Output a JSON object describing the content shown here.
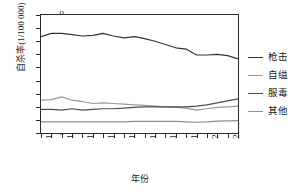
{
  "chart_data": {
    "type": "line",
    "title": "",
    "xlabel": "年份",
    "ylabel": "自杀率(1/100 000)",
    "xlim": [
      1985,
      2004
    ],
    "ylim": [
      0,
      9
    ],
    "yticks": [
      0,
      1,
      2,
      3,
      4,
      5,
      6,
      7,
      8,
      9
    ],
    "xticks": [
      1985,
      1987,
      1989,
      1991,
      1993,
      1995,
      1997,
      1999,
      2001,
      2003
    ],
    "x": [
      1985,
      1986,
      1987,
      1988,
      1989,
      1990,
      1991,
      1992,
      1993,
      1994,
      1995,
      1996,
      1997,
      1998,
      1999,
      2000,
      2001,
      2002,
      2003,
      2004
    ],
    "grid": false,
    "legend_position": "right",
    "series": [
      {
        "name": "枪击",
        "color": "#333333",
        "values": [
          7.35,
          7.6,
          7.6,
          7.5,
          7.4,
          7.45,
          7.6,
          7.4,
          7.25,
          7.35,
          7.2,
          7.0,
          6.75,
          6.5,
          6.4,
          5.95,
          5.95,
          6.0,
          5.9,
          5.65
        ]
      },
      {
        "name": "自缢",
        "color": "#9a9a9a",
        "values": [
          2.5,
          2.55,
          2.75,
          2.5,
          2.4,
          2.25,
          2.3,
          2.25,
          2.2,
          2.15,
          2.1,
          2.05,
          2.0,
          1.95,
          1.9,
          1.75,
          1.85,
          1.95,
          2.0,
          2.05
        ]
      },
      {
        "name": "服毒",
        "color": "#4d4d4d",
        "values": [
          1.8,
          1.8,
          1.75,
          1.85,
          1.75,
          1.8,
          1.85,
          1.85,
          1.9,
          1.95,
          2.0,
          2.0,
          2.0,
          2.0,
          2.0,
          2.05,
          2.15,
          2.3,
          2.45,
          2.6
        ]
      },
      {
        "name": "其他",
        "color": "#8f8f8f",
        "values": [
          0.85,
          0.85,
          0.85,
          0.85,
          0.85,
          0.85,
          0.85,
          0.85,
          0.85,
          0.88,
          0.88,
          0.88,
          0.88,
          0.88,
          0.85,
          0.82,
          0.85,
          0.9,
          0.93,
          0.95
        ]
      }
    ]
  }
}
